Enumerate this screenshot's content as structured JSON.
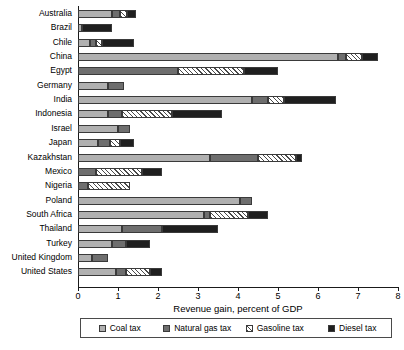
{
  "chart_data": {
    "type": "bar",
    "orientation": "horizontal",
    "stacked": true,
    "title": "",
    "xlabel": "Revenue gain, percent of GDP",
    "ylabel": "",
    "xlim": [
      0,
      8
    ],
    "xticks": [
      "0",
      "1",
      "2",
      "3",
      "4",
      "5",
      "6",
      "7",
      "8"
    ],
    "grid": false,
    "legend_position": "bottom",
    "categories": [
      "Australia",
      "Brazil",
      "Chile",
      "China",
      "Egypt",
      "Germany",
      "India",
      "Indonesia",
      "Israel",
      "Japan",
      "Kazakhstan",
      "Mexico",
      "Nigeria",
      "Poland",
      "South Africa",
      "Thailand",
      "Turkey",
      "United Kingdom",
      "United States"
    ],
    "series": [
      {
        "name": "Coal tax",
        "color": "#b0b0b0",
        "values": [
          0.85,
          0.1,
          0.3,
          6.5,
          0.0,
          0.75,
          4.35,
          0.75,
          1.0,
          0.5,
          3.3,
          0.0,
          0.0,
          4.05,
          3.15,
          1.1,
          0.85,
          0.35,
          0.95
        ]
      },
      {
        "name": "Natural gas tax",
        "color": "#6e6e6e",
        "values": [
          0.2,
          0.0,
          0.15,
          0.2,
          2.5,
          0.4,
          0.4,
          0.35,
          0.3,
          0.3,
          1.2,
          0.45,
          0.25,
          0.3,
          0.15,
          1.0,
          0.35,
          0.4,
          0.25
        ]
      },
      {
        "name": "Gasoline tax",
        "color": "#ffffff",
        "values": [
          0.17,
          0.0,
          0.15,
          0.4,
          1.65,
          0.0,
          0.4,
          1.25,
          0.0,
          0.25,
          0.95,
          1.15,
          1.05,
          0.0,
          0.95,
          0.0,
          0.0,
          0.0,
          0.6
        ]
      },
      {
        "name": "Diesel tax",
        "color": "#1f1f1f",
        "values": [
          0.23,
          0.75,
          0.8,
          0.4,
          0.85,
          0.0,
          1.3,
          1.25,
          0.0,
          0.35,
          0.15,
          0.5,
          0.0,
          0.0,
          0.5,
          1.4,
          0.6,
          0.0,
          0.3
        ]
      }
    ],
    "totals": [
      1.45,
      0.85,
      1.4,
      7.5,
      5.0,
      1.15,
      6.45,
      3.6,
      1.3,
      1.4,
      5.6,
      2.1,
      1.3,
      4.35,
      4.75,
      3.5,
      1.8,
      0.75,
      2.1
    ]
  },
  "legend": {
    "items": [
      {
        "label": "Coal tax",
        "key": "coal"
      },
      {
        "label": "Natural gas tax",
        "key": "gas"
      },
      {
        "label": "Gasoline tax",
        "key": "gasoline"
      },
      {
        "label": "Diesel tax",
        "key": "diesel"
      }
    ]
  }
}
